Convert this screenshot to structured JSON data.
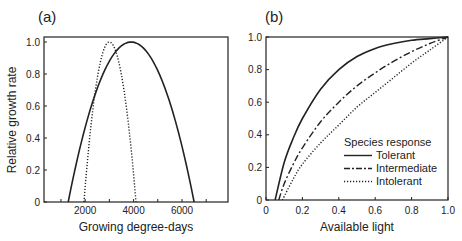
{
  "chart_data": [
    {
      "type": "line",
      "panel_label": "(a)",
      "title": "",
      "xlabel": "Growing degree-days",
      "ylabel": "Relative growth rate",
      "xlim": [
        300,
        7900
      ],
      "ylim": [
        0,
        1.0
      ],
      "xticks": [
        1000,
        2000,
        3000,
        4000,
        5000,
        6000,
        7000
      ],
      "xtick_labels": [
        "",
        "2000",
        "",
        "4000",
        "",
        "6000",
        ""
      ],
      "yticks": [
        0,
        0.2,
        0.4,
        0.6,
        0.8,
        1.0
      ],
      "ytick_labels": [
        "0",
        "0.2",
        "0.4",
        "0.6",
        "0.8",
        "1.0"
      ],
      "grid": false,
      "series": [
        {
          "name": "Broad tolerance",
          "style": "solid",
          "shape": "parabola",
          "x_min": 1300,
          "x_peak": 3900,
          "x_max": 6500,
          "peak": 1.0
        },
        {
          "name": "Narrow tolerance",
          "style": "dotted",
          "shape": "parabola",
          "x_min": 1950,
          "x_peak": 3000,
          "x_max": 4100,
          "peak": 1.0
        }
      ]
    },
    {
      "type": "line",
      "panel_label": "(b)",
      "title": "",
      "xlabel": "Available light",
      "ylabel": "",
      "xlim": [
        0,
        1.0
      ],
      "ylim": [
        0,
        1.0
      ],
      "xticks": [
        0,
        0.2,
        0.4,
        0.6,
        0.8,
        1.0
      ],
      "xtick_labels": [
        "0",
        "0.2",
        "0.4",
        "0.6",
        "0.8",
        "1.0"
      ],
      "yticks": [
        0,
        0.2,
        0.4,
        0.6,
        0.8,
        1.0
      ],
      "ytick_labels": [
        "0",
        "0.2",
        "0.4",
        "0.6",
        "0.8",
        "1.0"
      ],
      "grid": false,
      "legend": {
        "title": "Species response",
        "position": "lower-right"
      },
      "series": [
        {
          "name": "Tolerant",
          "style": "solid",
          "x": [
            0.05,
            0.1,
            0.15,
            0.2,
            0.3,
            0.4,
            0.5,
            0.6,
            0.7,
            0.8,
            0.9,
            1.0
          ],
          "y": [
            0.0,
            0.23,
            0.38,
            0.5,
            0.68,
            0.8,
            0.88,
            0.93,
            0.96,
            0.98,
            0.99,
            1.0
          ]
        },
        {
          "name": "Intermediate",
          "style": "dashdot",
          "x": [
            0.07,
            0.1,
            0.15,
            0.2,
            0.3,
            0.4,
            0.5,
            0.6,
            0.7,
            0.8,
            0.9,
            1.0
          ],
          "y": [
            0.0,
            0.1,
            0.22,
            0.32,
            0.48,
            0.6,
            0.7,
            0.78,
            0.85,
            0.91,
            0.96,
            1.0
          ]
        },
        {
          "name": "Intolerant",
          "style": "dotted",
          "x": [
            0.09,
            0.15,
            0.2,
            0.3,
            0.4,
            0.5,
            0.6,
            0.7,
            0.8,
            0.9,
            1.0
          ],
          "y": [
            0.0,
            0.13,
            0.22,
            0.35,
            0.46,
            0.57,
            0.66,
            0.75,
            0.84,
            0.92,
            1.0
          ]
        }
      ]
    }
  ]
}
